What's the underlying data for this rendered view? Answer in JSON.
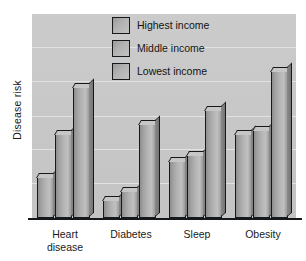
{
  "chart_data": {
    "type": "bar",
    "title": "",
    "xlabel": "",
    "ylabel": "Disease risk",
    "categories": [
      "Heart\ndisease",
      "Diabetes",
      "Sleep",
      "Obesity"
    ],
    "series": [
      {
        "name": "Highest income",
        "values": [
          20,
          9,
          28,
          41
        ]
      },
      {
        "name": "Middle income",
        "values": [
          41,
          13,
          31,
          43
        ]
      },
      {
        "name": "Lowest income",
        "values": [
          64,
          46,
          53,
          72
        ]
      }
    ],
    "ylim": [
      0,
      100
    ],
    "y_ticks_labeled": false,
    "grid": true,
    "gridline_positions": [
      17,
      34,
      50,
      67,
      84
    ],
    "legend_position": "top-center",
    "bar_fill_color": "#b4b4b4",
    "bar_edge_color": "#16191c",
    "plot_background_color": "#c8c8c8",
    "gridline_color": "#e2e2e2"
  },
  "legend": {
    "items": [
      {
        "label": "Highest income"
      },
      {
        "label": "Middle income"
      },
      {
        "label": "Lowest income"
      }
    ]
  },
  "axis": {
    "y_title": "Disease risk"
  }
}
